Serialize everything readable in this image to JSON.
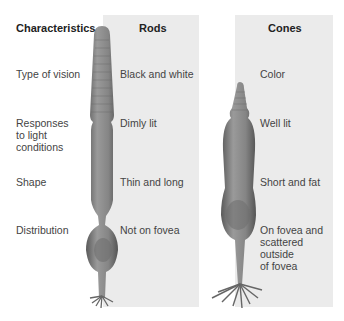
{
  "headers": {
    "characteristics": "Characteristics",
    "rods": "Rods",
    "cones": "Cones"
  },
  "rows": [
    {
      "label": "Type of vision",
      "rods": "Black and white",
      "cones": "Color"
    },
    {
      "label_lines": [
        "Responses",
        "to light",
        "conditions"
      ],
      "rods": "Dimly lit",
      "cones": "Well lit"
    },
    {
      "label": "Shape",
      "rods": "Thin and long",
      "cones": "Short and fat"
    },
    {
      "label": "Distribution",
      "rods": "Not on fovea",
      "cones_lines": [
        "On fovea and",
        "scattered",
        "outside",
        "of fovea"
      ]
    }
  ],
  "colors": {
    "panel_bg": "#ebebeb",
    "cell_fill": "#8a8a8a",
    "cell_dark": "#5e5e5e"
  }
}
